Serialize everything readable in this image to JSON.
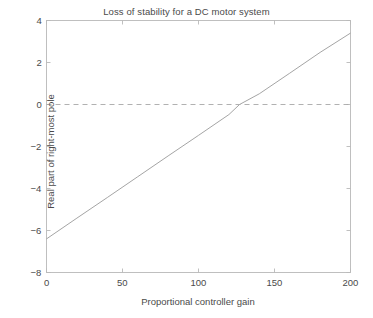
{
  "figure": {
    "background": "#ffffff",
    "axis_color": "#b9b9b9",
    "line_color": "#9a9a9a",
    "text_color": "#4a4a4a"
  },
  "chart_data": {
    "type": "line",
    "title": "Loss of stability for a DC motor system",
    "xlabel": "Proportional controller gain",
    "ylabel": "Real part of right-most pole",
    "xlim": [
      0,
      200
    ],
    "ylim": [
      -8,
      4
    ],
    "xticks": [
      0,
      50,
      100,
      150,
      200
    ],
    "xtick_labels": [
      "0",
      "50",
      "100",
      "150",
      "200"
    ],
    "yticks": [
      -8,
      -6,
      -4,
      -2,
      0,
      2,
      4
    ],
    "ytick_labels": [
      "-8",
      "-6",
      "-4",
      "-2",
      "0",
      "2",
      "4"
    ],
    "grid": false,
    "legend": null,
    "series": [
      {
        "name": "Real part of right-most pole",
        "style": "solid",
        "color": "#9a9a9a",
        "x": [
          0,
          20,
          40,
          60,
          80,
          100,
          120,
          127,
          140,
          160,
          180,
          200
        ],
        "y": [
          -6.4,
          -5.41,
          -4.43,
          -3.44,
          -2.45,
          -1.47,
          -0.48,
          0.0,
          0.51,
          1.49,
          2.48,
          3.4
        ]
      },
      {
        "name": "zero reference",
        "style": "dashed",
        "color": "#a8a8a8",
        "x": [
          0,
          200
        ],
        "y": [
          0,
          0
        ]
      }
    ],
    "annotations": [
      {
        "text": "zero crossing",
        "x": 127,
        "y": 0
      }
    ]
  }
}
